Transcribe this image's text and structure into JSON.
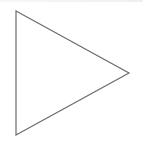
{
  "diagram": {
    "shape": "triangle",
    "orientation": "right",
    "icon": "play-triangle-icon",
    "vertices": [
      [
        16,
        11
      ],
      [
        129,
        73
      ],
      [
        16,
        135
      ]
    ],
    "stroke_color": "#6b6b6b",
    "fill_color": "#ffffff",
    "background_color": "#ffffff"
  }
}
